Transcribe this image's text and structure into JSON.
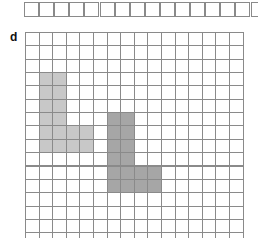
{
  "top_grid": {
    "cols": 16,
    "cell_w": 15.1,
    "cell_h": 14.5
  },
  "label": "d",
  "grid": {
    "cols": 16,
    "rows": 16,
    "cell_w": 13.6,
    "cell_h": 13.35,
    "line_color": "#8a8a8a"
  },
  "shapes": [
    {
      "name": "light-l-shape",
      "color": "#c8c8c8",
      "cells": [
        [
          1,
          3
        ],
        [
          2,
          3
        ],
        [
          1,
          4
        ],
        [
          2,
          4
        ],
        [
          1,
          5
        ],
        [
          2,
          5
        ],
        [
          1,
          6
        ],
        [
          2,
          6
        ],
        [
          1,
          7
        ],
        [
          2,
          7
        ],
        [
          3,
          7
        ],
        [
          4,
          7
        ],
        [
          1,
          8
        ],
        [
          2,
          8
        ],
        [
          3,
          8
        ],
        [
          4,
          8
        ]
      ]
    },
    {
      "name": "dark-l-shape",
      "color": "#a6a6a6",
      "cells": [
        [
          6,
          6
        ],
        [
          7,
          6
        ],
        [
          6,
          7
        ],
        [
          7,
          7
        ],
        [
          6,
          8
        ],
        [
          7,
          8
        ],
        [
          6,
          9
        ],
        [
          7,
          9
        ],
        [
          6,
          10
        ],
        [
          7,
          10
        ],
        [
          8,
          10
        ],
        [
          9,
          10
        ],
        [
          6,
          11
        ],
        [
          7,
          11
        ],
        [
          8,
          11
        ],
        [
          9,
          11
        ]
      ]
    }
  ]
}
